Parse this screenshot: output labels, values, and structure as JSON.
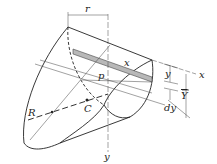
{
  "diagram": {
    "labels": {
      "r": "r",
      "x_strip": "x",
      "p": "p",
      "y_dim": "y",
      "x_axis": "x",
      "Y_bar": "Y",
      "dy": "dy",
      "R": "R",
      "C": "C",
      "y_axis": "y"
    },
    "colors": {
      "line": "#222222",
      "strip_fill": "#b8b8b8",
      "background": "#ffffff"
    }
  }
}
